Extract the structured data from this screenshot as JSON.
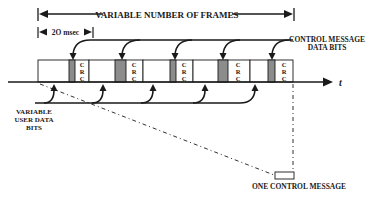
{
  "diagram": {
    "span_label": "VARIABLE NUMBER OF FRAMES",
    "frame_duration_label": "2O msec",
    "control_bits_label_line1": "CONTROL MESSAGE",
    "control_bits_label_line2": "DATA BITS",
    "user_bits_label_line1": "VARIABLE",
    "user_bits_label_line2": "USER DATA",
    "user_bits_label_line3": "BITS",
    "time_axis_label": "t",
    "one_message_label": "ONE CONTROL MESSAGE",
    "crc_letters": [
      "C",
      "R",
      "C"
    ],
    "frame_count": 5,
    "colors": {
      "ink": "#1a1a1a",
      "control_bit_fill": "#8c8c8c",
      "background": "#ffffff"
    }
  }
}
